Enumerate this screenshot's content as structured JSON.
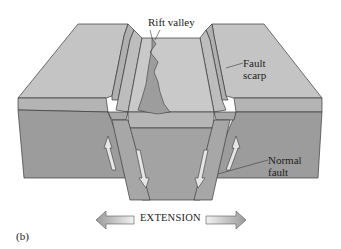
{
  "diagram": {
    "panel_label": "(b)",
    "labels": {
      "rift_valley": "Rift valley",
      "fault_scarp_line1": "Fault",
      "fault_scarp_line2": "scarp",
      "normal_fault_line1": "Normal",
      "normal_fault_line2": "fault",
      "extension": "EXTENSION"
    },
    "colors": {
      "top_surface": "#c6c6c6",
      "top_surface_dark": "#bdbdbd",
      "side_face": "#9a9a9a",
      "upper_layer_face": "#b3b3b3",
      "graben_floor": "#c9c9c9",
      "rift_crack": "#9d9d9d",
      "outline": "#3a3a3a",
      "arrow_fill": "#e0e0e0"
    }
  }
}
